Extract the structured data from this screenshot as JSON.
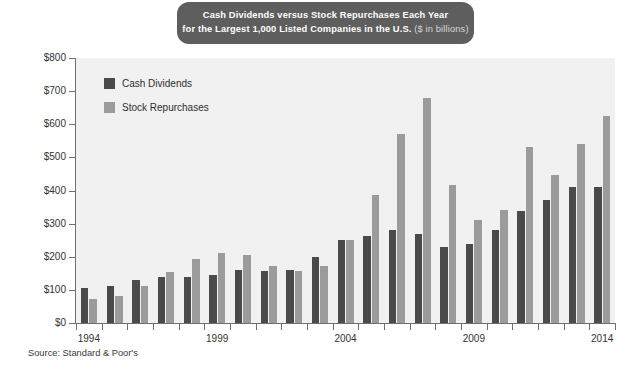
{
  "title": {
    "line1": "Cash Dividends versus Stock Repurchases Each Year",
    "line2_main": "for the Largest 1,000 Listed Companies in the U.S.",
    "line2_sub": " ($ in billions)"
  },
  "legend": {
    "items": [
      {
        "label": "Cash Dividends",
        "color": "#4a4a4a",
        "key": "dividends"
      },
      {
        "label": "Stock Repurchases",
        "color": "#9b9b9b",
        "key": "repurchases"
      }
    ]
  },
  "source": "Source: Standard & Poor's",
  "colors": {
    "dividends": "#4a4a4a",
    "repurchases": "#9b9b9b",
    "plot_background": "#f1f1f1",
    "banner": "#5e5e5e",
    "axis": "#6f6f6f"
  },
  "axes": {
    "y_ticks": [
      "$0",
      "$100",
      "$200",
      "$300",
      "$400",
      "$500",
      "$600",
      "$700",
      "$800"
    ],
    "x_ticks_labeled": [
      "1994",
      "1999",
      "2004",
      "2009",
      "2014"
    ]
  },
  "chart_data": {
    "type": "bar",
    "title": "Cash Dividends versus Stock Repurchases Each Year for the Largest 1,000 Listed Companies in the U.S. ($ in billions)",
    "xlabel": "",
    "ylabel": "$ in billions",
    "ylim": [
      0,
      800
    ],
    "ytick_values": [
      0,
      100,
      200,
      300,
      400,
      500,
      600,
      700,
      800
    ],
    "grid": false,
    "legend_position": "upper-left-inside",
    "categories": [
      "1994",
      "1995",
      "1996",
      "1997",
      "1998",
      "1999",
      "2000",
      "2001",
      "2002",
      "2003",
      "2004",
      "2005",
      "2006",
      "2007",
      "2008",
      "2009",
      "2010",
      "2011",
      "2012",
      "2013",
      "2014"
    ],
    "series": [
      {
        "name": "Cash Dividends",
        "color": "#4a4a4a",
        "values": [
          105,
          112,
          130,
          140,
          140,
          145,
          160,
          158,
          160,
          200,
          250,
          262,
          282,
          268,
          228,
          240,
          280,
          338,
          372,
          410,
          410
        ]
      },
      {
        "name": "Stock Repurchases",
        "color": "#9b9b9b",
        "values": [
          72,
          82,
          112,
          155,
          192,
          212,
          205,
          172,
          158,
          172,
          252,
          385,
          570,
          680,
          418,
          312,
          342,
          530,
          448,
          540,
          625
        ]
      }
    ]
  }
}
